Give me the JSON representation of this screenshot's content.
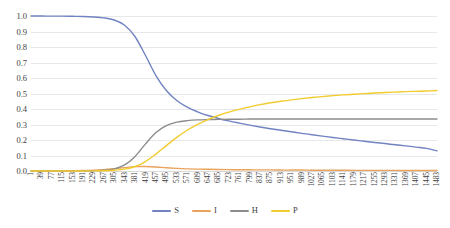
{
  "chart_data": {
    "type": "line",
    "title": "",
    "xlabel": "",
    "ylabel": "",
    "ylim": [
      0.0,
      1.0
    ],
    "xlim": [
      1,
      1483
    ],
    "grid": true,
    "legend_position": "bottom",
    "ytick_labels": [
      "1.0",
      "0.9",
      "0.8",
      "0.7",
      "0.6",
      "0.5",
      "0.4",
      "0.3",
      "0.2",
      "0.1",
      "0.0"
    ],
    "ytick_values": [
      1.0,
      0.9,
      0.8,
      0.7,
      0.6,
      0.5,
      0.4,
      0.3,
      0.2,
      0.1,
      0.0
    ],
    "xtick_labels": [
      "1",
      "39",
      "77",
      "115",
      "153",
      "191",
      "229",
      "267",
      "305",
      "343",
      "381",
      "419",
      "457",
      "495",
      "533",
      "571",
      "609",
      "647",
      "685",
      "723",
      "761",
      "799",
      "837",
      "875",
      "913",
      "951",
      "989",
      "1027",
      "1065",
      "1103",
      "1141",
      "1179",
      "1217",
      "1255",
      "1293",
      "1331",
      "1369",
      "1407",
      "1445",
      "1483"
    ],
    "x": [
      1,
      39,
      77,
      115,
      153,
      191,
      229,
      267,
      305,
      343,
      381,
      419,
      457,
      495,
      533,
      571,
      609,
      647,
      685,
      723,
      761,
      799,
      837,
      875,
      913,
      951,
      989,
      1027,
      1065,
      1103,
      1141,
      1179,
      1217,
      1255,
      1293,
      1331,
      1369,
      1407,
      1445,
      1483
    ],
    "series": [
      {
        "name": "S",
        "color": "#7283c2",
        "values": [
          1.0,
          1.0,
          0.999,
          0.999,
          0.998,
          0.997,
          0.994,
          0.988,
          0.974,
          0.94,
          0.866,
          0.745,
          0.616,
          0.519,
          0.455,
          0.412,
          0.382,
          0.358,
          0.339,
          0.323,
          0.309,
          0.296,
          0.284,
          0.273,
          0.263,
          0.253,
          0.243,
          0.234,
          0.225,
          0.216,
          0.208,
          0.2,
          0.192,
          0.184,
          0.177,
          0.169,
          0.162,
          0.154,
          0.146,
          0.13
        ]
      },
      {
        "name": "I",
        "color": "#e8a35c",
        "values": [
          0.0,
          0.0,
          0.001,
          0.001,
          0.002,
          0.003,
          0.005,
          0.009,
          0.015,
          0.022,
          0.028,
          0.029,
          0.026,
          0.021,
          0.017,
          0.014,
          0.012,
          0.011,
          0.01,
          0.009,
          0.008,
          0.008,
          0.007,
          0.007,
          0.006,
          0.006,
          0.006,
          0.005,
          0.005,
          0.005,
          0.005,
          0.004,
          0.004,
          0.004,
          0.004,
          0.004,
          0.003,
          0.003,
          0.003,
          0.003
        ]
      },
      {
        "name": "H",
        "color": "#8c8c8c",
        "values": [
          0.0,
          0.0,
          0.0,
          0.0,
          0.001,
          0.001,
          0.002,
          0.005,
          0.014,
          0.039,
          0.094,
          0.175,
          0.248,
          0.293,
          0.315,
          0.325,
          0.33,
          0.332,
          0.333,
          0.334,
          0.334,
          0.335,
          0.335,
          0.335,
          0.335,
          0.335,
          0.335,
          0.335,
          0.335,
          0.335,
          0.335,
          0.335,
          0.335,
          0.335,
          0.335,
          0.335,
          0.335,
          0.335,
          0.335,
          0.335
        ]
      },
      {
        "name": "P",
        "color": "#f2cc2e",
        "values": [
          0.0,
          0.0,
          0.0,
          0.0,
          0.0,
          0.0,
          0.001,
          0.002,
          0.005,
          0.012,
          0.029,
          0.061,
          0.109,
          0.164,
          0.217,
          0.263,
          0.301,
          0.332,
          0.358,
          0.38,
          0.398,
          0.414,
          0.428,
          0.44,
          0.45,
          0.459,
          0.467,
          0.474,
          0.48,
          0.486,
          0.491,
          0.495,
          0.499,
          0.503,
          0.506,
          0.509,
          0.512,
          0.514,
          0.516,
          0.519
        ]
      }
    ]
  },
  "legend": {
    "items": [
      {
        "label": "S",
        "color": "#7283c2"
      },
      {
        "label": "I",
        "color": "#e8a35c"
      },
      {
        "label": "H",
        "color": "#8c8c8c"
      },
      {
        "label": "P",
        "color": "#f2cc2e"
      }
    ]
  }
}
